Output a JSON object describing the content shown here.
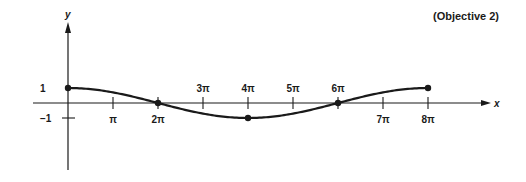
{
  "annotation": "(Objective 2)",
  "chart_data": {
    "type": "line",
    "title": "",
    "function_description": "y = cos(x/4), 0 ≤ x ≤ 8π",
    "xlabel": "x",
    "ylabel": "y",
    "x_ticks": [
      {
        "value": 1,
        "label": "π",
        "label_pos": "below"
      },
      {
        "value": 2,
        "label": "2π",
        "label_pos": "below"
      },
      {
        "value": 3,
        "label": "3π",
        "label_pos": "above"
      },
      {
        "value": 4,
        "label": "4π",
        "label_pos": "above"
      },
      {
        "value": 5,
        "label": "5π",
        "label_pos": "above"
      },
      {
        "value": 6,
        "label": "6π",
        "label_pos": "above"
      },
      {
        "value": 7,
        "label": "7π",
        "label_pos": "below"
      },
      {
        "value": 8,
        "label": "8π",
        "label_pos": "below"
      }
    ],
    "x_tick_unit": "π",
    "y_ticks": [
      {
        "value": 1,
        "label": "1"
      },
      {
        "value": -1,
        "label": "−1"
      }
    ],
    "xlim_pi": [
      -0.8,
      7.4
    ],
    "ylim": [
      -1.5,
      1.6
    ],
    "grid": false,
    "legend": null,
    "series": [
      {
        "name": "y = cos(x/4)",
        "x_pi": [
          0,
          0.5,
          1,
          1.5,
          2,
          2.5,
          3,
          3.5,
          4,
          4.5,
          5,
          5.5,
          6,
          6.5,
          7,
          7.5,
          8
        ],
        "y": [
          1,
          0.924,
          0.707,
          0.383,
          0,
          -0.383,
          -0.707,
          -0.924,
          -1,
          -0.924,
          -0.707,
          -0.383,
          0,
          0.383,
          0.707,
          0.924,
          1
        ]
      }
    ],
    "marked_points": [
      {
        "x_pi": 0,
        "y": 1
      },
      {
        "x_pi": 2,
        "y": 0
      },
      {
        "x_pi": 4,
        "y": -1
      },
      {
        "x_pi": 6,
        "y": 0
      },
      {
        "x_pi": 8,
        "y": 1
      }
    ]
  }
}
